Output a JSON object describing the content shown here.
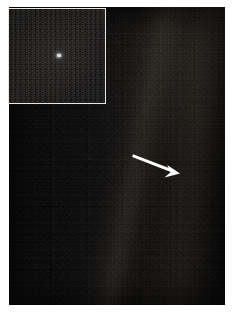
{
  "figure": {
    "kind": "astronomical-photograph",
    "width_px": 236,
    "height_px": 317,
    "background_color": "#ffffff",
    "plate_color": "#090909"
  },
  "photo": {
    "label": "deep-space-star-field",
    "left": 9,
    "top": 7,
    "width": 216,
    "height": 298
  },
  "sunbeam": {
    "label": "scattered-sunlight-band",
    "orientation": "diagonal",
    "tilt_degrees": 11,
    "color": "#ffe6c3",
    "position": "right-of-center, running top to bottom"
  },
  "arrow": {
    "label": "pointer-arrow",
    "color": "#ffffff",
    "tail_x": 124,
    "tail_y": 148,
    "tip_x": 170,
    "tip_y": 166,
    "direction": "down-right"
  },
  "inset": {
    "label": "magnified-detail-inset",
    "border_color": "#e8e6e2",
    "left": 8,
    "top": 8,
    "width": 98,
    "height": 96,
    "dot": {
      "label": "pale-blue-dot",
      "color": "#d8dde0",
      "center_x": 50,
      "center_y": 47,
      "size_px": 4
    }
  }
}
